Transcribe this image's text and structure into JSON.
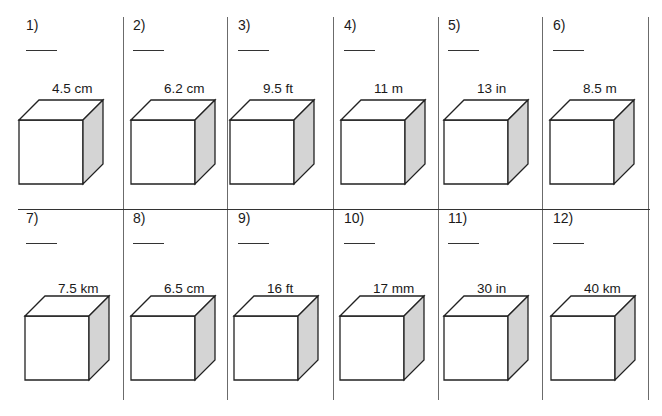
{
  "worksheet": {
    "cube_colors": {
      "front": "#ffffff",
      "top": "#ffffff",
      "side": "#d4d4d4",
      "stroke": "#222222"
    },
    "rows": [
      {
        "problems": [
          {
            "number": "1)",
            "answer_blank": "____",
            "side_length": "4.5 cm"
          },
          {
            "number": "2)",
            "answer_blank": "____",
            "side_length": "6.2 cm"
          },
          {
            "number": "3)",
            "answer_blank": "____",
            "side_length": "9.5 ft"
          },
          {
            "number": "4)",
            "answer_blank": "____",
            "side_length": "11 m"
          },
          {
            "number": "5)",
            "answer_blank": "____",
            "side_length": "13 in"
          },
          {
            "number": "6)",
            "answer_blank": "____",
            "side_length": "8.5 m"
          }
        ]
      },
      {
        "problems": [
          {
            "number": "7)",
            "answer_blank": "____",
            "side_length": "7.5 km"
          },
          {
            "number": "8)",
            "answer_blank": "____",
            "side_length": "6.5 cm"
          },
          {
            "number": "9)",
            "answer_blank": "____",
            "side_length": "16 ft"
          },
          {
            "number": "10)",
            "answer_blank": "____",
            "side_length": "17 mm"
          },
          {
            "number": "11)",
            "answer_blank": "____",
            "side_length": "30 in"
          },
          {
            "number": "12)",
            "answer_blank": "____",
            "side_length": "40 km"
          }
        ]
      }
    ]
  }
}
